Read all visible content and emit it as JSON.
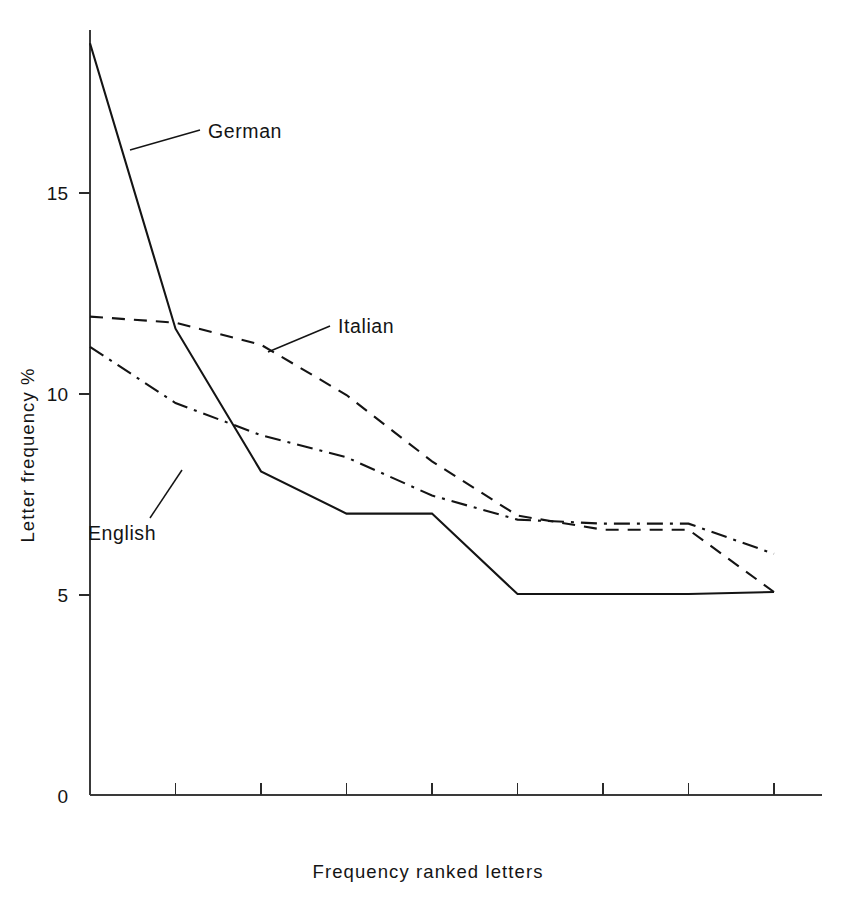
{
  "chart_data": {
    "type": "line",
    "title": "",
    "xlabel": "Frequency ranked letters",
    "ylabel": "Letter frequency %",
    "xlim": [
      0,
      8
    ],
    "ylim": [
      0,
      19.8
    ],
    "grid": false,
    "legend_position": "inline-annotations",
    "y_ticks": [
      "0",
      "5",
      "10",
      "15"
    ],
    "y_tick_values": [
      0,
      5,
      10,
      15
    ],
    "x_tick_values": [
      1,
      2,
      3,
      4,
      5,
      6,
      7,
      8
    ],
    "x_tick_labels": [
      "",
      "",
      "",
      "",
      "",
      "",
      "",
      ""
    ],
    "x": [
      0,
      1,
      2,
      3,
      4,
      5,
      6,
      7,
      8
    ],
    "series": [
      {
        "name": "German",
        "style": "solid",
        "values": [
          18.7,
          11.6,
          8.05,
          7.0,
          7.0,
          5.0,
          5.0,
          5.0,
          5.05
        ]
      },
      {
        "name": "Italian",
        "style": "dashed",
        "values": [
          11.9,
          11.75,
          11.2,
          9.95,
          8.3,
          6.95,
          6.6,
          6.6,
          5.05
        ]
      },
      {
        "name": "English",
        "style": "dash-dot",
        "values": [
          11.15,
          9.75,
          8.95,
          8.4,
          7.45,
          6.85,
          6.75,
          6.75,
          6.0
        ]
      }
    ],
    "annotations": [
      {
        "text": "German",
        "series": "German"
      },
      {
        "text": "Italian",
        "series": "Italian"
      },
      {
        "text": "English",
        "series": "English"
      }
    ]
  },
  "axes": {
    "y_label": "Letter frequency %",
    "x_label": "Frequency ranked letters",
    "y_tick_0": "0",
    "y_tick_5": "5",
    "y_tick_10": "10",
    "y_tick_15": "15"
  },
  "labels": {
    "german": "German",
    "italian": "Italian",
    "english": "English"
  },
  "colors": {
    "line": "#141414",
    "axis": "#3a3a3a",
    "background": "#ffffff"
  }
}
